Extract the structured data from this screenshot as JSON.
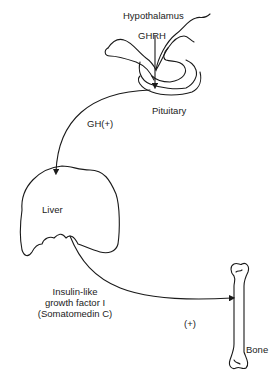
{
  "diagram": {
    "labels": {
      "hypothalamus": "Hypothalamus",
      "ghrh": "GHRH",
      "pituitary": "Pituitary",
      "gh": "GH(+)",
      "liver": "Liver",
      "igf_line1": "Insulin-like",
      "igf_line2": "growth factor I",
      "igf_line3": "(Somatomedin C)",
      "igf_effect": "(+)",
      "bone": "Bone"
    },
    "colors": {
      "stroke": "#1a1a1a",
      "text": "#222222",
      "background": "#ffffff"
    }
  }
}
